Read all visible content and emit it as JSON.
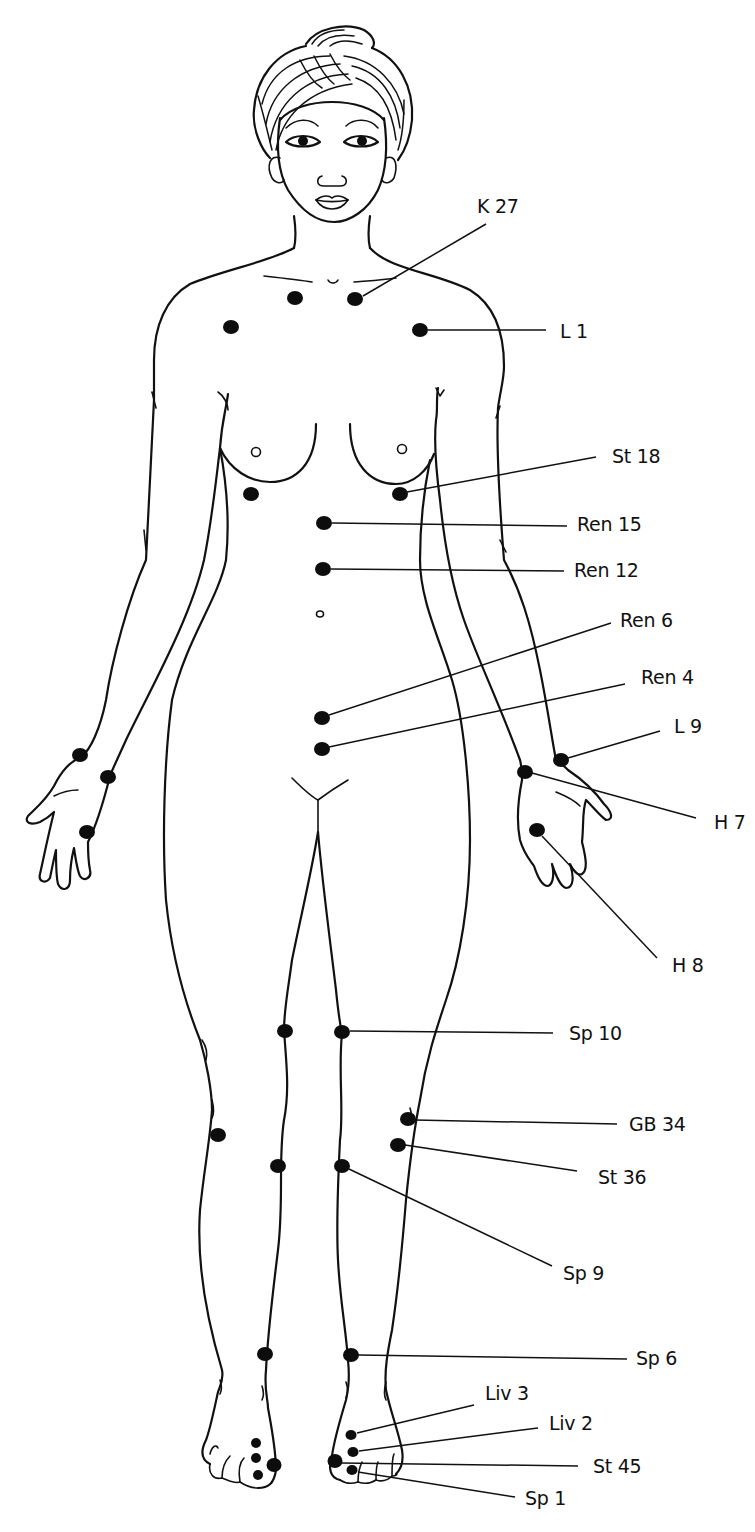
{
  "diagram": {
    "colors": {
      "line": "#111111",
      "point": "#0d0d0d",
      "background": "#ffffff"
    },
    "labeled_points": [
      {
        "id": "k27",
        "label": "K 27",
        "point": [
          355,
          299
        ],
        "label_pos": [
          477,
          213
        ],
        "leader_end": [
          486,
          224
        ]
      },
      {
        "id": "l1",
        "label": "L 1",
        "point": [
          420,
          330
        ],
        "label_pos": [
          560,
          338
        ],
        "leader_end": [
          546,
          330
        ]
      },
      {
        "id": "st18",
        "label": "St 18",
        "point": [
          400,
          494
        ],
        "label_pos": [
          612,
          463
        ],
        "leader_end": [
          596,
          457
        ]
      },
      {
        "id": "ren15",
        "label": "Ren 15",
        "point": [
          324,
          523
        ],
        "label_pos": [
          577,
          531
        ],
        "leader_end": [
          567,
          526
        ]
      },
      {
        "id": "ren12",
        "label": "Ren 12",
        "point": [
          323,
          569
        ],
        "label_pos": [
          574,
          577
        ],
        "leader_end": [
          564,
          571
        ]
      },
      {
        "id": "ren6",
        "label": "Ren 6",
        "point": [
          322,
          718
        ],
        "label_pos": [
          620,
          627
        ],
        "leader_end": [
          611,
          623
        ]
      },
      {
        "id": "ren4",
        "label": "Ren 4",
        "point": [
          322,
          749
        ],
        "label_pos": [
          641,
          684
        ],
        "leader_end": [
          625,
          684
        ]
      },
      {
        "id": "l9",
        "label": "L 9",
        "point": [
          561,
          760
        ],
        "label_pos": [
          674,
          733
        ],
        "leader_end": [
          660,
          731
        ]
      },
      {
        "id": "h7",
        "label": "H 7",
        "point": [
          525,
          772
        ],
        "label_pos": [
          714,
          829
        ],
        "leader_end": [
          696,
          818
        ]
      },
      {
        "id": "h8",
        "label": "H 8",
        "point": [
          537,
          830
        ],
        "label_pos": [
          672,
          972
        ],
        "leader_end": [
          657,
          958
        ]
      },
      {
        "id": "sp10",
        "label": "Sp 10",
        "point": [
          342,
          1032
        ],
        "label_pos": [
          569,
          1040
        ],
        "leader_end": [
          553,
          1033
        ]
      },
      {
        "id": "gb34",
        "label": "GB 34",
        "point": [
          408,
          1119
        ],
        "label_pos": [
          629,
          1131
        ],
        "leader_end": [
          617,
          1124
        ]
      },
      {
        "id": "st36",
        "label": "St 36",
        "point": [
          398,
          1145
        ],
        "label_pos": [
          598,
          1184
        ],
        "leader_end": [
          577,
          1171
        ]
      },
      {
        "id": "sp9",
        "label": "Sp 9",
        "point": [
          342,
          1166
        ],
        "label_pos": [
          563,
          1280
        ],
        "leader_end": [
          552,
          1266
        ]
      },
      {
        "id": "sp6",
        "label": "Sp 6",
        "point": [
          351,
          1355
        ],
        "label_pos": [
          636,
          1365
        ],
        "leader_end": [
          627,
          1359
        ]
      },
      {
        "id": "liv3",
        "label": "Liv 3",
        "point": [
          351,
          1435
        ],
        "label_pos": [
          485,
          1400
        ],
        "leader_end": [
          474,
          1405
        ]
      },
      {
        "id": "liv2",
        "label": "Liv 2",
        "point": [
          353,
          1452
        ],
        "label_pos": [
          549,
          1430
        ],
        "leader_end": [
          538,
          1428
        ]
      },
      {
        "id": "st45",
        "label": "St 45",
        "point": [
          335,
          1461
        ],
        "label_pos": [
          593,
          1473
        ],
        "leader_end": [
          578,
          1466
        ]
      },
      {
        "id": "sp1",
        "label": "Sp 1",
        "point": [
          352,
          1470
        ],
        "label_pos": [
          525,
          1505
        ],
        "leader_end": [
          515,
          1497
        ]
      }
    ],
    "unlabeled_points": [
      {
        "side": "left-mirror",
        "near": "K 27",
        "point": [
          295,
          298
        ]
      },
      {
        "side": "left-mirror",
        "near": "L 1",
        "point": [
          231,
          327
        ]
      },
      {
        "side": "left-mirror",
        "near": "St 18",
        "point": [
          251,
          494
        ]
      },
      {
        "side": "left-mirror",
        "near": "L 9",
        "point": [
          80,
          755
        ]
      },
      {
        "side": "left-mirror",
        "near": "H 7",
        "point": [
          108,
          777
        ]
      },
      {
        "side": "left-mirror",
        "near": "H 8",
        "point": [
          87,
          832
        ]
      },
      {
        "side": "left-mirror",
        "near": "Sp 10",
        "point": [
          285,
          1031
        ]
      },
      {
        "side": "left-mirror",
        "near": "GB 34",
        "point": [
          218,
          1135
        ]
      },
      {
        "side": "left-mirror",
        "near": "Sp 9",
        "point": [
          278,
          1166
        ]
      },
      {
        "side": "left-mirror",
        "near": "Sp 6",
        "point": [
          265,
          1354
        ]
      },
      {
        "side": "left-mirror",
        "near": "Liv 3",
        "point": [
          256,
          1443
        ]
      },
      {
        "side": "left-mirror",
        "near": "Liv 2",
        "point": [
          256,
          1458
        ]
      },
      {
        "side": "left-mirror",
        "near": "St 45",
        "point": [
          274,
          1465
        ]
      },
      {
        "side": "left-mirror",
        "near": "Sp 1",
        "point": [
          258,
          1475
        ]
      }
    ]
  }
}
